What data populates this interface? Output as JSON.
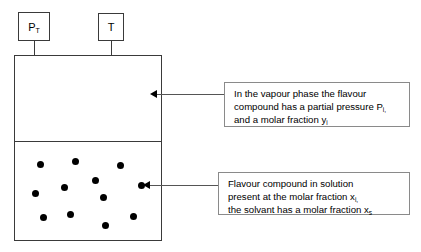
{
  "diagram": {
    "sensors": [
      {
        "id": "total-pressure",
        "label": "P",
        "subscript": "T"
      },
      {
        "id": "temperature",
        "label": "T",
        "subscript": ""
      }
    ],
    "vessel": {
      "vapour_phase_label": "vapour phase",
      "liquid_phase_label": "solution"
    },
    "particles": {
      "count": 12,
      "color": "#000000",
      "positions": [
        {
          "x": 37,
          "y": 161
        },
        {
          "x": 72,
          "y": 158
        },
        {
          "x": 117,
          "y": 162
        },
        {
          "x": 92,
          "y": 177
        },
        {
          "x": 61,
          "y": 184
        },
        {
          "x": 32,
          "y": 190
        },
        {
          "x": 138,
          "y": 182
        },
        {
          "x": 100,
          "y": 194
        },
        {
          "x": 40,
          "y": 214
        },
        {
          "x": 67,
          "y": 211
        },
        {
          "x": 102,
          "y": 222
        },
        {
          "x": 130,
          "y": 213
        }
      ]
    },
    "callouts": [
      {
        "id": "vapour-phase-callout",
        "lines": [
          {
            "text": "In the vapour phase the flavour",
            "sub": ""
          },
          {
            "text": "compound has a partial pressure P",
            "sub": "i,"
          },
          {
            "text": "and a molar fraction y",
            "sub": "i"
          }
        ]
      },
      {
        "id": "solution-callout",
        "lines": [
          {
            "text": "Flavour compound in solution",
            "sub": ""
          },
          {
            "text": "present at the molar fraction x",
            "sub": "i,"
          },
          {
            "text": "the solvant has a molar fraction x",
            "sub": "s"
          }
        ]
      }
    ],
    "colors": {
      "line": "#3a3a3a",
      "callout_border": "#8a8a8a",
      "particle": "#000000",
      "background": "#ffffff"
    }
  }
}
